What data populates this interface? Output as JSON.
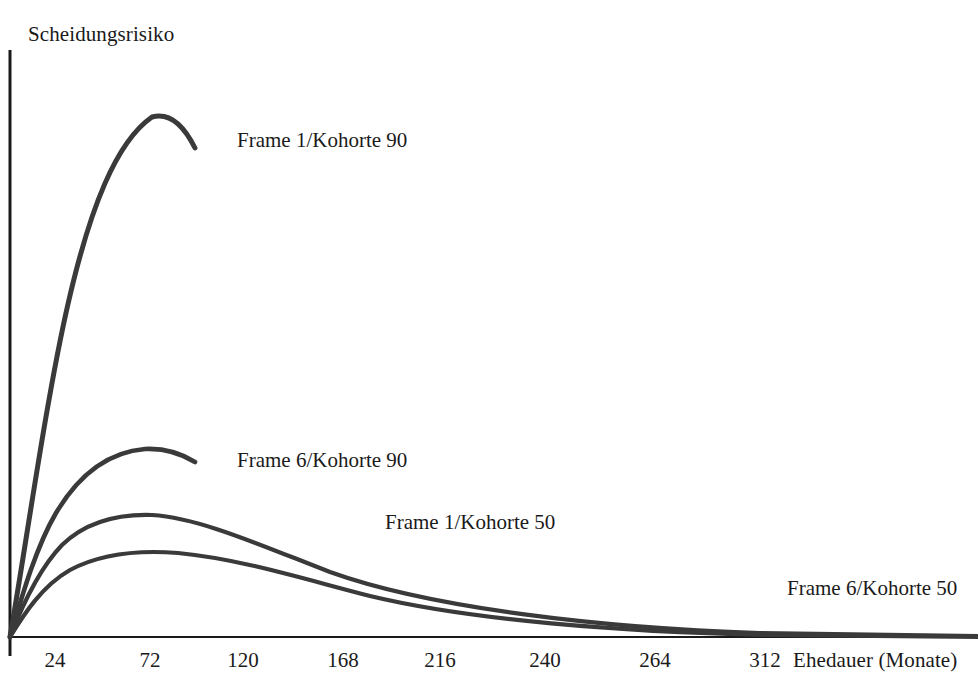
{
  "chart_data": {
    "type": "line",
    "title": "",
    "subtitle": "",
    "xlabel": "Ehedauer (Monate)",
    "ylabel": "Scheidungsrisiko",
    "grid": false,
    "legend_position": "inline-labels",
    "xlim": [
      0,
      336
    ],
    "ylim": [
      0,
      1
    ],
    "xticks": [
      24,
      72,
      120,
      168,
      216,
      240,
      264,
      312
    ],
    "xtick_labels": [
      "24",
      "72",
      "120",
      "168",
      "216",
      "240",
      "264",
      "312"
    ],
    "yticks": [],
    "ytick_labels": [],
    "line_color": "#3a3a3a",
    "axis_color": "#1a1a1a",
    "note": "Hazard curves of divorce risk by marriage duration; y-axis unlabeled (relative risk).",
    "series": [
      {
        "name": "Frame 1/Kohorte 90",
        "label_x": 237,
        "label_y": 130,
        "peak_x_months": 54,
        "peak_y": 0.905,
        "x": [
          0,
          6,
          12,
          18,
          24,
          30,
          36,
          42,
          48,
          54,
          60,
          66,
          72
        ],
        "y": [
          0.0,
          0.225,
          0.432,
          0.6,
          0.722,
          0.805,
          0.862,
          0.893,
          0.903,
          0.905,
          0.895,
          0.872,
          0.845
        ]
      },
      {
        "name": "Frame 6/Kohorte 90",
        "label_x": 237,
        "label_y": 450,
        "peak_x_months": 50,
        "peak_y": 0.362,
        "x": [
          0,
          6,
          12,
          18,
          24,
          30,
          36,
          42,
          48,
          54,
          60,
          66,
          72
        ],
        "y": [
          0.0,
          0.102,
          0.186,
          0.25,
          0.3,
          0.333,
          0.353,
          0.361,
          0.362,
          0.36,
          0.354,
          0.346,
          0.338
        ]
      },
      {
        "name": "Frame 1/Kohorte 50",
        "label_x": 385,
        "label_y": 512,
        "peak_x_months": 54,
        "peak_y": 0.258,
        "x": [
          0,
          12,
          24,
          36,
          48,
          60,
          72,
          96,
          120,
          144,
          168,
          192,
          216,
          240,
          264,
          288,
          312,
          336
        ],
        "y": [
          0.0,
          0.138,
          0.21,
          0.245,
          0.257,
          0.258,
          0.252,
          0.232,
          0.206,
          0.178,
          0.15,
          0.124,
          0.1,
          0.078,
          0.058,
          0.04,
          0.024,
          0.01
        ]
      },
      {
        "name": "Frame 6/Kohorte 50",
        "label_x": 787,
        "label_y": 578,
        "peak_x_months": 66,
        "peak_y": 0.194,
        "x": [
          0,
          12,
          24,
          36,
          48,
          60,
          72,
          96,
          120,
          144,
          168,
          192,
          216,
          240,
          264,
          288,
          312,
          336
        ],
        "y": [
          0.0,
          0.093,
          0.146,
          0.175,
          0.189,
          0.194,
          0.193,
          0.182,
          0.165,
          0.146,
          0.126,
          0.107,
          0.088,
          0.07,
          0.053,
          0.037,
          0.022,
          0.009
        ]
      }
    ]
  },
  "axes": {
    "y_title": "Scheidungsrisiko",
    "x_title": "Ehedauer (Monate)"
  },
  "ticks": [
    {
      "label": "24",
      "x": 55
    },
    {
      "label": "72",
      "x": 150
    },
    {
      "label": "120",
      "x": 243
    },
    {
      "label": "168",
      "x": 343
    },
    {
      "label": "216",
      "x": 440
    },
    {
      "label": "240",
      "x": 545
    },
    {
      "label": "264",
      "x": 655
    },
    {
      "label": "312",
      "x": 765
    }
  ],
  "series_labels": [
    {
      "text": "Frame 1/Kohorte 90",
      "x": 237,
      "y": 128
    },
    {
      "text": "Frame 6/Kohorte 90",
      "x": 237,
      "y": 448
    },
    {
      "text": "Frame 1/Kohorte 50",
      "x": 385,
      "y": 510
    },
    {
      "text": "Frame 6/Kohorte 50",
      "x": 787,
      "y": 576
    }
  ]
}
